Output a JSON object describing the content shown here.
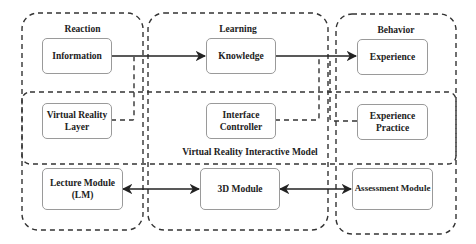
{
  "diagram": {
    "groups": {
      "reaction": "Reaction",
      "learning": "Learning",
      "behavior": "Behavior",
      "vr_model": "Virtual Reality Interactive Model"
    },
    "nodes": {
      "information": "Information",
      "knowledge": "Knowledge",
      "experience": "Experience",
      "vr_layer_line1": "Virtual Reality",
      "vr_layer_line2": "Layer",
      "interface_line1": "Interface",
      "interface_line2": "Controller",
      "practice_line1": "Experience",
      "practice_line2": "Practice",
      "lecture_line1": "Lecture Module",
      "lecture_line2": "(LM)",
      "module3d": "3D Module",
      "assessment": "Assessment Module"
    },
    "edges": [
      {
        "from": "Information",
        "to": "Knowledge",
        "style": "solid",
        "arrow": "end"
      },
      {
        "from": "Knowledge",
        "to": "Experience",
        "style": "solid",
        "arrow": "end"
      },
      {
        "from": "Virtual Reality Layer",
        "to": "Information-Knowledge line",
        "style": "dashed"
      },
      {
        "from": "Interface Controller",
        "to": "Knowledge-Experience line",
        "style": "dashed"
      },
      {
        "from": "Experience Practice",
        "to": "Knowledge-Experience line",
        "style": "dashed"
      },
      {
        "from": "Lecture Module (LM)",
        "to": "3D Module",
        "style": "solid",
        "arrow": "both"
      },
      {
        "from": "3D Module",
        "to": "Assessment Module",
        "style": "solid",
        "arrow": "both"
      }
    ],
    "colors": {
      "line": "#222222",
      "box_border": "#9a9a9a",
      "text": "#222222"
    }
  }
}
